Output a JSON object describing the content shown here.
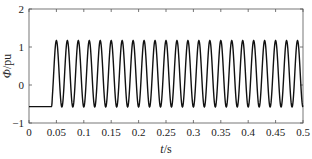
{
  "chart_data": {
    "type": "line",
    "title": "",
    "xlabel": "t/s",
    "ylabel": "Φ/pu",
    "xlim": [
      0,
      0.5
    ],
    "ylim": [
      -1,
      2
    ],
    "xticks": [
      0,
      0.05,
      0.1,
      0.15,
      0.2,
      0.25,
      0.3,
      0.35,
      0.4,
      0.45,
      0.5
    ],
    "xtick_labels": [
      "0",
      "0.05",
      "0.1",
      "0.15",
      "0.2",
      "0.25",
      "0.3",
      "0.35",
      "0.4",
      "0.45",
      "0.5"
    ],
    "yticks": [
      -1,
      0,
      1,
      2
    ],
    "ytick_labels": [
      "−1",
      "0",
      "1",
      "2"
    ],
    "grid": false,
    "legend": null,
    "series": [
      {
        "name": "Φ",
        "color": "#111111",
        "description": "Constant at about -0.57 pu until t≈0.04 s, then sinusoidal oscillation at 50 Hz between about -0.58 and 1.17 pu until 0.5 s",
        "segments": [
          {
            "kind": "constant",
            "t_start": 0,
            "t_end": 0.04,
            "value": -0.57
          },
          {
            "kind": "sine",
            "t_start": 0.04,
            "t_end": 0.5,
            "frequency_hz": 50,
            "max": 1.17,
            "min": -0.58,
            "first_peak_t": 0.05
          }
        ]
      }
    ]
  },
  "axes": {
    "x_title_italic": "t",
    "x_title_unit": "/s",
    "y_title_italic": "Φ",
    "y_title_unit": "/pu"
  }
}
